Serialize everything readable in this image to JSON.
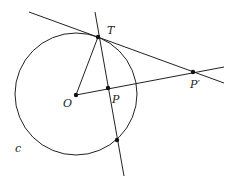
{
  "diagram": {
    "labels": {
      "T": "T",
      "O": "O",
      "P": "P",
      "P_prime": "P′",
      "c": "c"
    },
    "points": {
      "T": [
        98,
        37
      ],
      "O": [
        76,
        95
      ],
      "P": [
        108,
        88
      ],
      "P_prime": [
        193,
        72
      ],
      "S": [
        117,
        140
      ]
    },
    "circle": {
      "cx": 76,
      "cy": 94,
      "r": 61
    },
    "colors": {
      "stroke": "#222222",
      "background": "#ffffff"
    }
  }
}
